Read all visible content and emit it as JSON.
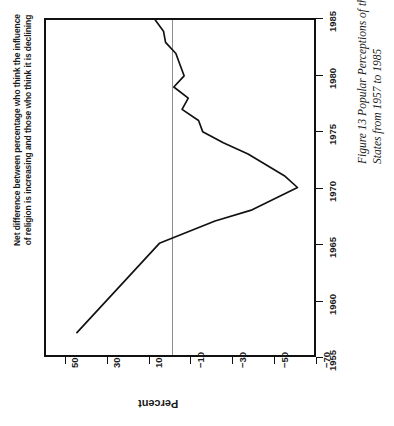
{
  "figure": {
    "title_lines": [
      "Net difference between percentage who think the influence",
      "of religion is increasing and those who think it is declining"
    ],
    "source": "Source: Gallup 1985, pp. 16–17",
    "caption": "Figure 13   Popular Perceptions of the Influence of Religion in the United States from 1957 to 1985",
    "caption_lines": [
      "Figure 13   Popular Perceptions of the Influence of Religion in the United",
      "States from 1957 to 1985"
    ],
    "orientation": "rotated-90-ccw",
    "line_color": "#111111",
    "zero_line_color": "#8d8d8d",
    "frame_color": "#111111"
  },
  "chart_data": {
    "type": "line",
    "title": "Net difference between percentage who think the influence of religion is increasing and those who think it is declining",
    "xlabel": "",
    "ylabel": "Percent",
    "xlim": [
      1955,
      1985
    ],
    "ylim": [
      -70,
      60
    ],
    "xticks": [
      1955,
      1960,
      1965,
      1970,
      1975,
      1980,
      1985
    ],
    "xtick_labels": [
      "1955",
      "1960",
      "1965",
      "1970",
      "1975",
      "1980",
      "1985"
    ],
    "yticks": [
      50,
      30,
      10,
      -10,
      -30,
      -50,
      -70
    ],
    "ytick_labels": [
      "50",
      "30",
      "10",
      "−10",
      "−30",
      "−50",
      "−70"
    ],
    "grid": false,
    "legend": null,
    "zero_reference_line": 0,
    "x": [
      1957,
      1962,
      1965,
      1967,
      1968,
      1970,
      1971,
      1973,
      1974,
      1975,
      1976,
      1977,
      1978,
      1979,
      1980,
      1981,
      1982,
      1983,
      1984,
      1985
    ],
    "values": [
      45,
      20,
      5,
      -22,
      -40,
      -62,
      -56,
      -38,
      -26,
      -16,
      -14,
      -6,
      -9,
      -2,
      -7,
      -5,
      -3,
      2,
      3,
      7
    ],
    "series": [
      {
        "name": "Net difference (increasing minus declining)",
        "values": [
          45,
          20,
          5,
          -22,
          -40,
          -62,
          -56,
          -38,
          -26,
          -16,
          -14,
          -6,
          -9,
          -2,
          -7,
          -5,
          -3,
          2,
          3,
          7
        ]
      }
    ],
    "annotations": [
      "Source: Gallup 1985, pp. 16–17"
    ]
  }
}
